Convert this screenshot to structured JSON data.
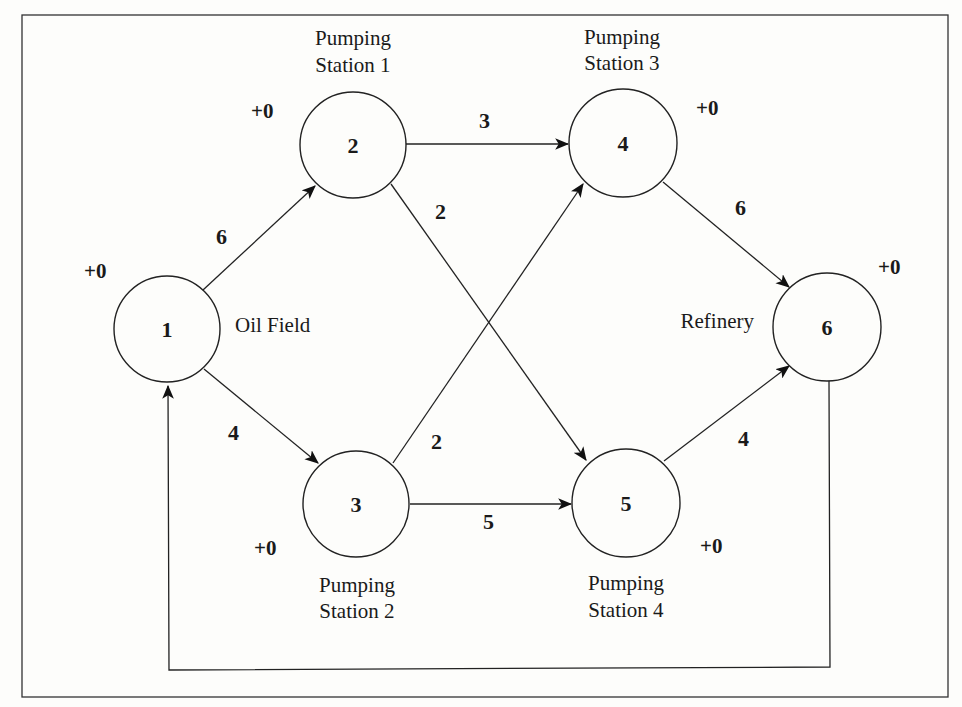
{
  "diagram": {
    "type": "network-flow",
    "nodes": [
      {
        "id": "1",
        "label": "1",
        "caption": [
          "Oil Field"
        ],
        "supply": "+0"
      },
      {
        "id": "2",
        "label": "2",
        "caption": [
          "Pumping",
          "Station 1"
        ],
        "supply": "+0"
      },
      {
        "id": "3",
        "label": "3",
        "caption": [
          "Pumping",
          "Station 2"
        ],
        "supply": "+0"
      },
      {
        "id": "4",
        "label": "4",
        "caption": [
          "Pumping",
          "Station 3"
        ],
        "supply": "+0"
      },
      {
        "id": "5",
        "label": "5",
        "caption": [
          "Pumping",
          "Station 4"
        ],
        "supply": "+0"
      },
      {
        "id": "6",
        "label": "6",
        "caption": [
          "Refinery"
        ],
        "supply": "+0"
      }
    ],
    "edges": [
      {
        "from": "1",
        "to": "2",
        "capacity": "6"
      },
      {
        "from": "1",
        "to": "3",
        "capacity": "4"
      },
      {
        "from": "2",
        "to": "4",
        "capacity": "3"
      },
      {
        "from": "2",
        "to": "5",
        "capacity": "2"
      },
      {
        "from": "3",
        "to": "4",
        "capacity": "2"
      },
      {
        "from": "3",
        "to": "5",
        "capacity": "5"
      },
      {
        "from": "4",
        "to": "6",
        "capacity": "6"
      },
      {
        "from": "5",
        "to": "6",
        "capacity": "4"
      },
      {
        "from": "6",
        "to": "1",
        "capacity": ""
      }
    ]
  }
}
